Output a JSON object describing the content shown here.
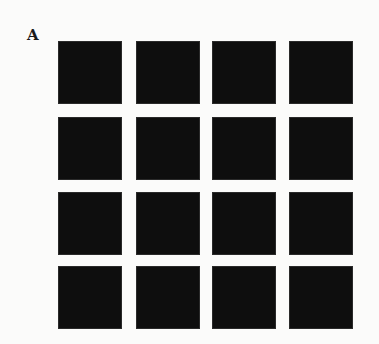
{
  "figure": {
    "panel_label": "A",
    "background_color": "#fbfbfa",
    "square_color": "#0e0e0e",
    "grid": {
      "rows": 4,
      "cols": 4,
      "col_x": [
        58,
        136,
        212,
        289
      ],
      "row_y": [
        41,
        117,
        192,
        266
      ],
      "square_width": 64,
      "square_height": 63
    }
  }
}
